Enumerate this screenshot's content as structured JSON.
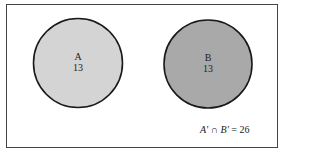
{
  "diagram": {
    "type": "venn",
    "colors": {
      "frame_border": "#444444",
      "circle_outline": "#1a1a1a",
      "circle_a_fill": "#d4d4d4",
      "circle_b_fill": "#a9a9a9",
      "background": "#ffffff"
    },
    "sets": [
      {
        "name": "A",
        "count": "13"
      },
      {
        "name": "B",
        "count": "13"
      }
    ],
    "complement": {
      "set_a": "A′",
      "op": "∩",
      "set_b": "B′",
      "equals": "= 26"
    }
  }
}
